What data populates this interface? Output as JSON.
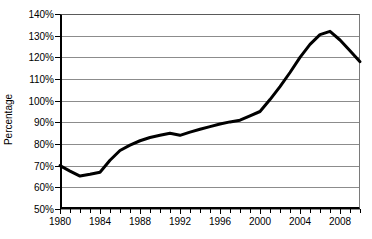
{
  "chart_data": {
    "type": "line",
    "title": "",
    "xlabel": "",
    "ylabel": "Percentage",
    "xlim": [
      1980,
      2010
    ],
    "ylim": [
      50,
      140
    ],
    "ytick_labels": [
      "140%",
      "130%",
      "120%",
      "110%",
      "100%",
      "90%",
      "80%",
      "70%",
      "60%",
      "50%"
    ],
    "ytick_values": [
      140,
      130,
      120,
      110,
      100,
      90,
      80,
      70,
      60,
      50
    ],
    "xtick_labels": [
      "1980",
      "1984",
      "1988",
      "1992",
      "1996",
      "2000",
      "2004",
      "2008"
    ],
    "xtick_values": [
      1980,
      1984,
      1988,
      1992,
      1996,
      2000,
      2004,
      2008
    ],
    "x_minor_tick_interval": 1,
    "grid": "horizontal",
    "legend": "none",
    "series": [
      {
        "name": "Percentage",
        "color": "#000000",
        "line_width": 3,
        "x": [
          1980,
          1981,
          1982,
          1983,
          1984,
          1985,
          1986,
          1987,
          1988,
          1989,
          1990,
          1991,
          1992,
          1993,
          1994,
          1995,
          1996,
          1997,
          1998,
          1999,
          2000,
          2001,
          2002,
          2003,
          2004,
          2005,
          2006,
          2007,
          2008,
          2009,
          2010
        ],
        "values": [
          70,
          67.5,
          65.2,
          66.0,
          67.0,
          72.5,
          77.0,
          79.5,
          81.5,
          83.0,
          84.0,
          85.0,
          84.0,
          85.5,
          86.8,
          88.0,
          89.2,
          90.2,
          91.0,
          93.0,
          95.0,
          100.5,
          106.5,
          113.0,
          120.0,
          126.0,
          130.5,
          132.0,
          128.0,
          123.0,
          118.0
        ]
      }
    ]
  },
  "axis": {
    "y_title": "Percentage"
  }
}
